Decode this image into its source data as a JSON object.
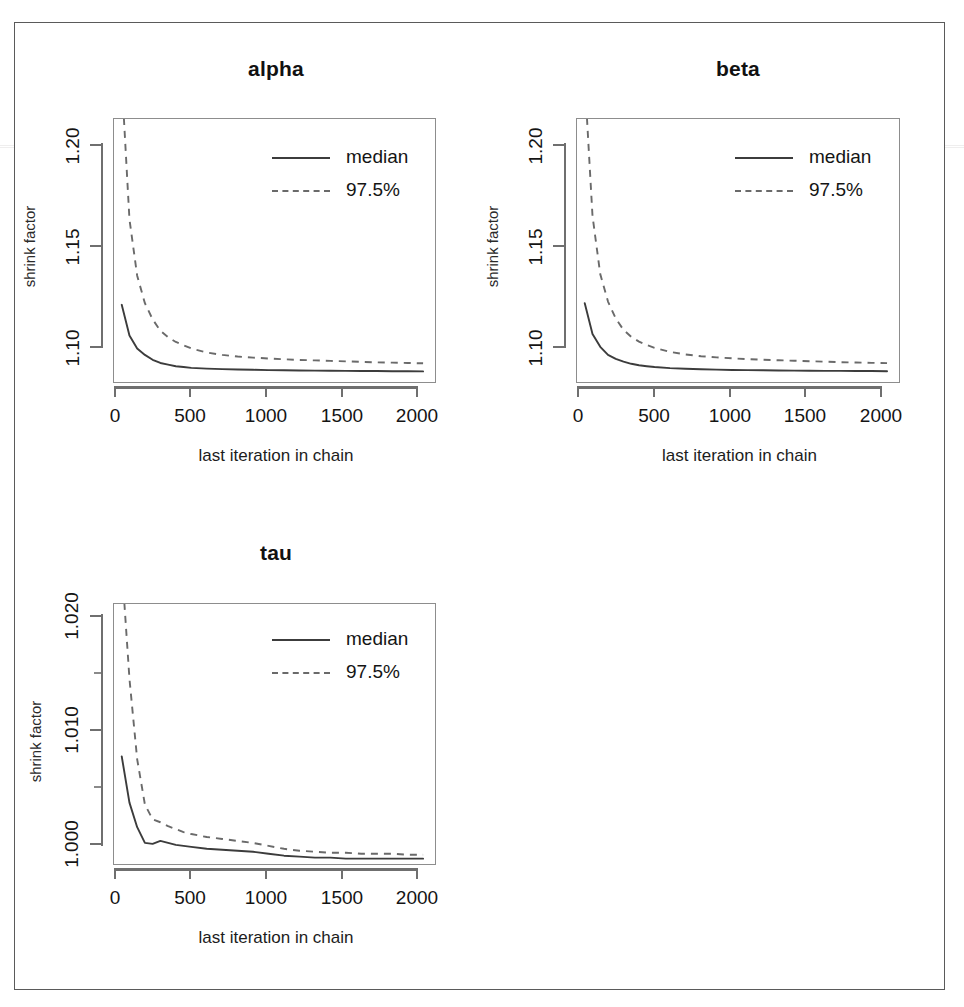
{
  "figure": {
    "kind": "gelman-rubin-shrink-factor-panels",
    "panel_count": 3,
    "x_axis_title": "last iteration in chain",
    "y_axis_title": "shrink factor",
    "legend": {
      "median_label": "median",
      "upper_label": "97.5%",
      "median_style": "solid",
      "upper_style": "dashed"
    },
    "colors": {
      "median_line": "#3c3c3c",
      "upper_line": "#6a6a6a",
      "axis": "#6f6f6f",
      "box": "#8d8d8d",
      "frame": "#5a5a5a",
      "text": "#141414",
      "background": "#ffffff"
    }
  },
  "chart_data": [
    {
      "type": "line",
      "title": "alpha",
      "xlabel": "last iteration in chain",
      "ylabel": "shrink factor",
      "xlim": [
        0,
        2090
      ],
      "ylim": [
        1.068,
        1.232
      ],
      "xticks": [
        0,
        500,
        1000,
        1500,
        2000
      ],
      "xtick_labels": [
        "0",
        "500",
        "1000",
        "1500",
        "2000"
      ],
      "yticks": [
        1.1,
        1.15,
        1.2
      ],
      "ytick_labels": [
        "1.10",
        "1.15",
        "1.20"
      ],
      "grid": false,
      "legend_position": "top-right",
      "x": [
        50,
        100,
        150,
        200,
        250,
        300,
        350,
        400,
        450,
        500,
        600,
        700,
        800,
        900,
        1000,
        1100,
        1200,
        1300,
        1400,
        1500,
        1600,
        1700,
        1800,
        1900,
        2000
      ],
      "series": [
        {
          "name": "median",
          "style": "solid",
          "values": [
            1.117,
            1.098,
            1.09,
            1.086,
            1.083,
            1.081,
            1.08,
            1.079,
            1.0785,
            1.078,
            1.0775,
            1.0772,
            1.077,
            1.0768,
            1.0766,
            1.0765,
            1.0764,
            1.0763,
            1.0762,
            1.0761,
            1.076,
            1.076,
            1.0759,
            1.0759,
            1.0758
          ]
        },
        {
          "name": "97.5%",
          "style": "dashed",
          "values": [
            1.262,
            1.17,
            1.135,
            1.118,
            1.108,
            1.101,
            1.097,
            1.094,
            1.092,
            1.09,
            1.0875,
            1.086,
            1.085,
            1.0843,
            1.0838,
            1.0833,
            1.0829,
            1.0826,
            1.0823,
            1.082,
            1.0817,
            1.0814,
            1.0812,
            1.081,
            1.0808
          ]
        }
      ]
    },
    {
      "type": "line",
      "title": "beta",
      "xlabel": "last iteration in chain",
      "ylabel": "shrink factor",
      "xlim": [
        0,
        2090
      ],
      "ylim": [
        1.068,
        1.232
      ],
      "xticks": [
        0,
        500,
        1000,
        1500,
        2000
      ],
      "xtick_labels": [
        "0",
        "500",
        "1000",
        "1500",
        "2000"
      ],
      "yticks": [
        1.1,
        1.15,
        1.2
      ],
      "ytick_labels": [
        "1.10",
        "1.15",
        "1.20"
      ],
      "grid": false,
      "legend_position": "top-right",
      "x": [
        50,
        100,
        150,
        200,
        250,
        300,
        350,
        400,
        450,
        500,
        600,
        700,
        800,
        900,
        1000,
        1100,
        1200,
        1300,
        1400,
        1500,
        1600,
        1700,
        1800,
        1900,
        2000
      ],
      "series": [
        {
          "name": "median",
          "style": "solid",
          "values": [
            1.118,
            1.099,
            1.091,
            1.086,
            1.0835,
            1.0818,
            1.0805,
            1.0796,
            1.079,
            1.0785,
            1.0778,
            1.0774,
            1.0771,
            1.0769,
            1.0767,
            1.0766,
            1.0765,
            1.0764,
            1.0763,
            1.0762,
            1.0761,
            1.0761,
            1.076,
            1.076,
            1.0759
          ]
        },
        {
          "name": "97.5%",
          "style": "dashed",
          "values": [
            1.265,
            1.172,
            1.136,
            1.119,
            1.1085,
            1.1015,
            1.0972,
            1.0942,
            1.0921,
            1.0904,
            1.0879,
            1.0863,
            1.0852,
            1.0845,
            1.0839,
            1.0834,
            1.083,
            1.0827,
            1.0824,
            1.0821,
            1.0818,
            1.0815,
            1.0813,
            1.0811,
            1.0809
          ]
        }
      ]
    },
    {
      "type": "line",
      "title": "tau",
      "xlabel": "last iteration in chain",
      "ylabel": "shrink factor",
      "xlim": [
        0,
        2090
      ],
      "ylim": [
        0.99955,
        1.0262
      ],
      "xticks": [
        0,
        500,
        1000,
        1500,
        2000
      ],
      "xtick_labels": [
        "0",
        "500",
        "1000",
        "1500",
        "2000"
      ],
      "yticks": [
        1.0,
        1.01,
        1.02
      ],
      "ytick_labels": [
        "1.000",
        "1.010",
        "1.020"
      ],
      "yminor": [
        1.005,
        1.015,
        1.025
      ],
      "grid": false,
      "legend_position": "top-right",
      "x": [
        50,
        100,
        150,
        200,
        250,
        300,
        350,
        400,
        450,
        500,
        600,
        700,
        800,
        900,
        1000,
        1100,
        1200,
        1300,
        1400,
        1500,
        1600,
        1700,
        1800,
        1900,
        2000
      ],
      "series": [
        {
          "name": "median",
          "style": "solid",
          "values": [
            1.0107,
            1.006,
            1.0035,
            1.0019,
            1.0018,
            1.0021,
            1.0019,
            1.0017,
            1.0016,
            1.0015,
            1.0013,
            1.0012,
            1.0011,
            1.001,
            1.0008,
            1.0006,
            1.0005,
            1.0004,
            1.0004,
            1.0003,
            1.0003,
            1.0003,
            1.0003,
            1.0003,
            1.0003
          ]
        },
        {
          "name": "97.5%",
          "style": "dashed",
          "values": [
            1.032,
            1.0186,
            1.0104,
            1.0058,
            1.0043,
            1.004,
            1.0036,
            1.0033,
            1.003,
            1.0028,
            1.0025,
            1.0023,
            1.0021,
            1.0019,
            1.0016,
            1.0013,
            1.0011,
            1.001,
            1.0009,
            1.0009,
            1.0008,
            1.0008,
            1.0008,
            1.0007,
            1.0007
          ]
        }
      ]
    }
  ]
}
